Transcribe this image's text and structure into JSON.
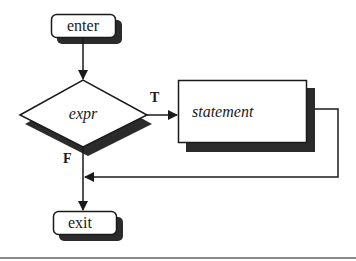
{
  "diagram": {
    "type": "flowchart",
    "nodes": {
      "enter": {
        "label": "enter",
        "shape": "rounded-rect"
      },
      "expr": {
        "label": "expr",
        "shape": "diamond"
      },
      "statement": {
        "label": "statement",
        "shape": "rect"
      },
      "exit": {
        "label": "exit",
        "shape": "rounded-rect"
      }
    },
    "edges": [
      {
        "from": "enter",
        "to": "expr",
        "label": ""
      },
      {
        "from": "expr",
        "to": "statement",
        "label": "T"
      },
      {
        "from": "statement",
        "to": "expr-exit-junction",
        "label": ""
      },
      {
        "from": "expr",
        "to": "exit",
        "label": "F"
      }
    ],
    "edge_labels": {
      "true": "T",
      "false": "F"
    }
  },
  "colors": {
    "stroke": "#1a1a1a",
    "shadow": "#2b2b2b",
    "fill": "#ffffff",
    "rule": "#8a8a8a"
  }
}
